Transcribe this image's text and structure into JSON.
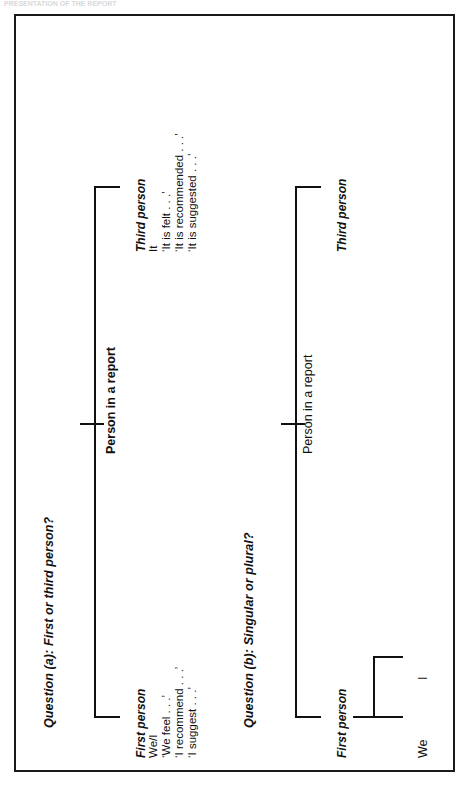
{
  "page": {
    "running_head": "PRESENTATION OF THE REPORT"
  },
  "figure": {
    "question_a": {
      "label": "Question (a): First or third person?",
      "root": "Person in a report",
      "branches": [
        {
          "head": "First person",
          "items": [
            "We/I",
            "‘We feel . . .’",
            "‘I recommend . . .’",
            "‘I suggest . . .’"
          ]
        },
        {
          "head": "Third person",
          "items": [
            "It",
            "‘It is felt . . .’",
            "‘It is recommended . . .’",
            "‘It is suggested . . .’"
          ]
        }
      ]
    },
    "question_b": {
      "label": "Question (b): Singular or plural?",
      "root": "Person in a report",
      "branches": [
        {
          "head": "First person",
          "leaves": [
            "We",
            "I"
          ]
        },
        {
          "head": "Third person",
          "leaves": []
        }
      ]
    }
  }
}
